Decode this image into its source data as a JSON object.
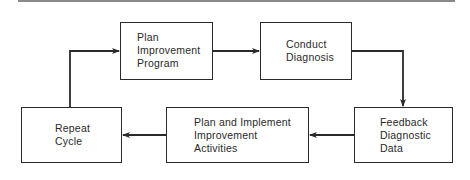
{
  "diagram": {
    "type": "cycle-flowchart",
    "nodes": [
      {
        "id": "plan-program",
        "lines": [
          "Plan",
          "Improvement",
          "Program"
        ]
      },
      {
        "id": "conduct-diagnosis",
        "lines": [
          "Conduct",
          "Diagnosis"
        ]
      },
      {
        "id": "feedback-data",
        "lines": [
          "Feedback",
          "Diagnostic",
          "Data"
        ]
      },
      {
        "id": "plan-implement",
        "lines": [
          "Plan and Implement",
          "Improvement",
          "Activities"
        ]
      },
      {
        "id": "repeat-cycle",
        "lines": [
          "Repeat",
          "Cycle"
        ]
      }
    ],
    "edges": [
      {
        "from": "plan-program",
        "to": "conduct-diagnosis"
      },
      {
        "from": "conduct-diagnosis",
        "to": "feedback-data"
      },
      {
        "from": "feedback-data",
        "to": "plan-implement"
      },
      {
        "from": "plan-implement",
        "to": "repeat-cycle"
      },
      {
        "from": "repeat-cycle",
        "to": "plan-program"
      }
    ],
    "colors": {
      "stroke": "#2a2a2a",
      "rule": "#8a8a8a",
      "background": "#ffffff"
    }
  }
}
